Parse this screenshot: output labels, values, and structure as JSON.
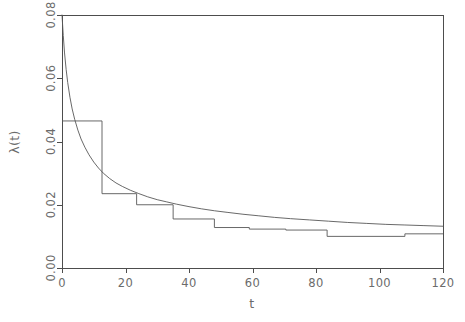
{
  "figure": {
    "background_color": "#ffffff",
    "line_color": "#585858",
    "axis_color": "#4d4d4d",
    "text_color": "#6b6b6b"
  },
  "chart_data": {
    "type": "line",
    "title": "",
    "xlabel": "t",
    "ylabel": "λ(t)",
    "xlim": [
      0,
      120
    ],
    "ylim": [
      0.0,
      0.08
    ],
    "xticks": [
      0,
      20,
      40,
      60,
      80,
      100,
      120
    ],
    "xticklabels": [
      "0",
      "20",
      "40",
      "60",
      "80",
      "100",
      "120"
    ],
    "yticks": [
      0.0,
      0.02,
      0.04,
      0.06,
      0.08
    ],
    "yticklabels": [
      "0.00",
      "0.02",
      "0.04",
      "0.06",
      "0.08"
    ],
    "grid": false,
    "legend": null,
    "series": [
      {
        "name": "smooth-hazard-estimate",
        "style": "solid-curve",
        "x": [
          0.0,
          0.4,
          0.8,
          1.3,
          1.8,
          2.5,
          3.2,
          4.0,
          5.0,
          6.0,
          7.2,
          8.5,
          10.0,
          11.5,
          13.0,
          15.0,
          17.0,
          19.0,
          21.5,
          24.0,
          27.0,
          30.0,
          33.0,
          36.0,
          40.0,
          44.0,
          48.0,
          52.0,
          57.0,
          62.0,
          67.0,
          72.0,
          78.0,
          84.0,
          90.0,
          96.0,
          102.0,
          108.0,
          114.0,
          120.0
        ],
        "y": [
          0.08,
          0.0735,
          0.068,
          0.0628,
          0.0586,
          0.054,
          0.0503,
          0.047,
          0.0436,
          0.0408,
          0.0382,
          0.0358,
          0.0335,
          0.0316,
          0.03,
          0.0283,
          0.0269,
          0.0258,
          0.0246,
          0.0236,
          0.0225,
          0.0216,
          0.0209,
          0.0202,
          0.0194,
          0.0187,
          0.0181,
          0.0176,
          0.017,
          0.0165,
          0.016,
          0.0156,
          0.0152,
          0.0148,
          0.0144,
          0.0141,
          0.0138,
          0.0136,
          0.0134,
          0.0132
        ]
      },
      {
        "name": "piecewise-constant-hazard",
        "style": "step-function",
        "step_edges": [
          0.0,
          12.6,
          23.5,
          35.0,
          48.0,
          59.0,
          70.5,
          83.5,
          108.0,
          120.0
        ],
        "step_values": [
          0.0465,
          0.0235,
          0.02,
          0.0155,
          0.0128,
          0.0123,
          0.012,
          0.01,
          0.0108
        ]
      }
    ]
  }
}
